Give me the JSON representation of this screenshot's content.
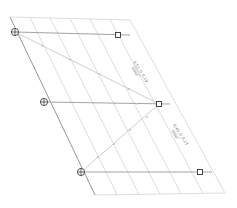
{
  "diagram": {
    "type": "structural-bracing-frame",
    "nodes": [
      {
        "id": "n1",
        "x": 15,
        "y": 32,
        "symbol": "pinned-support"
      },
      {
        "id": "n2",
        "x": 44,
        "y": 102,
        "symbol": "pinned-support"
      },
      {
        "id": "n3",
        "x": 81,
        "y": 172,
        "symbol": "pinned-support"
      }
    ],
    "end_points": [
      {
        "id": "e1",
        "x": 118,
        "y": 35
      },
      {
        "id": "e2",
        "x": 159,
        "y": 104
      },
      {
        "id": "e3",
        "x": 200,
        "y": 172
      }
    ],
    "labels": [
      {
        "id": "brace-label-1",
        "line1": "6.51_0_0.19",
        "line2": "Steel"
      },
      {
        "id": "brace-label-2",
        "line1": "6.45_0_0.17",
        "line2": "Steel"
      }
    ],
    "colors": {
      "grid": "#d4d4d4",
      "edge": "#8a8a8a",
      "marker": "#333333",
      "label": "#777777"
    }
  }
}
